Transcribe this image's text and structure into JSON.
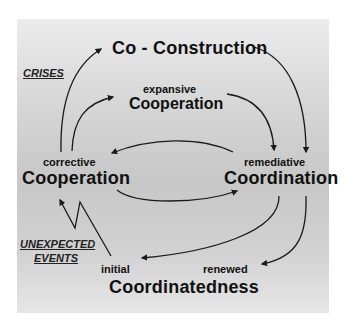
{
  "diagram": {
    "nodes": {
      "co_construction": {
        "label": "Co - Construction"
      },
      "expansive_cooperation": {
        "qualifier": "expansive",
        "label": "Cooperation"
      },
      "corrective_cooperation": {
        "qualifier": "corrective",
        "label": "Cooperation"
      },
      "remediative_coordination": {
        "qualifier": "remediative",
        "label": "Coordination"
      },
      "coordinatedness": {
        "initial": "initial",
        "renewed": "renewed",
        "label": "Coordinatedness"
      }
    },
    "triggers": {
      "crises": "CRISES",
      "unexpected_events_line1": "UNEXPECTED",
      "unexpected_events_line2": "EVENTS"
    },
    "edges": [
      {
        "from": "corrective_cooperation",
        "to": "co_construction",
        "trigger": "CRISES"
      },
      {
        "from": "corrective_cooperation",
        "to": "expansive_cooperation"
      },
      {
        "from": "co_construction",
        "to": "remediative_coordination"
      },
      {
        "from": "expansive_cooperation",
        "to": "remediative_coordination"
      },
      {
        "from": "remediative_coordination",
        "to": "corrective_cooperation"
      },
      {
        "from": "corrective_cooperation",
        "to": "remediative_coordination"
      },
      {
        "from": "remediative_coordination",
        "to": "initial_coordinatedness"
      },
      {
        "from": "remediative_coordination",
        "to": "renewed_coordinatedness"
      },
      {
        "from": "initial_coordinatedness",
        "to": "corrective_cooperation",
        "trigger": "UNEXPECTED EVENTS"
      }
    ],
    "colors": {
      "panel": "#d4d4d4",
      "text": "#111111",
      "arrow": "#1a1a1a"
    }
  }
}
